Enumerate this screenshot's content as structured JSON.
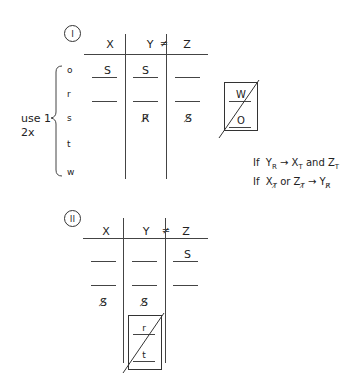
{
  "diagram": {
    "table1": {
      "label": "I",
      "columns": [
        "X",
        "Y",
        "Z"
      ],
      "neq_symbol": "≠",
      "rows": [
        {
          "label": "o",
          "cells": [
            "S",
            "S",
            ""
          ]
        },
        {
          "label": "r",
          "cells": [
            "",
            "",
            ""
          ]
        },
        {
          "label": "s",
          "cells": [
            "",
            "R̸",
            "S̸"
          ]
        },
        {
          "label": "t",
          "cells": [
            "",
            "",
            ""
          ]
        },
        {
          "label": "w",
          "cells": [
            "",
            "",
            ""
          ]
        }
      ],
      "brace_note_line1": "use 1",
      "brace_note_line2": "2x",
      "crossed_box": {
        "top": "W",
        "bottom": "O"
      }
    },
    "rules": {
      "rule1": {
        "prefix": "If",
        "a": "Y",
        "a_sub": "R",
        "arrow": "→",
        "b": "X",
        "b_sub": "T",
        "conj": "and",
        "c": "Z",
        "c_sub": "T"
      },
      "rule2": {
        "prefix": "If",
        "a": "X",
        "a_sub": "T̸",
        "conj": "or",
        "b": "Z",
        "b_sub": "T̸",
        "arrow": "→",
        "c": "Y",
        "c_sub": "R̸"
      }
    },
    "table2": {
      "label": "II",
      "columns": [
        "X",
        "Y",
        "Z"
      ],
      "neq_symbol": "≠",
      "rows": [
        {
          "cells": [
            "",
            "",
            "S"
          ]
        },
        {
          "cells": [
            "",
            "",
            ""
          ]
        },
        {
          "cells": [
            "S̸",
            "S̸",
            ""
          ]
        }
      ],
      "crossed_box": {
        "top": "r",
        "bottom": "t"
      }
    }
  }
}
